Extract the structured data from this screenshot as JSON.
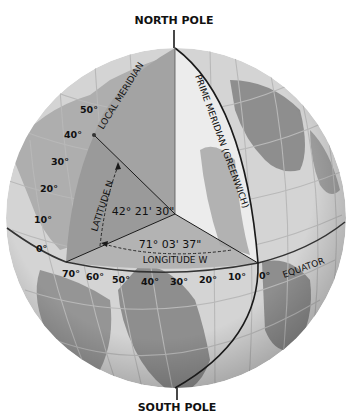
{
  "colors": {
    "ocean": "#d2d2d2",
    "land": "#8c8c8c",
    "grid": "#b4b4b4",
    "cutaway_left": "#a6a6a6",
    "cutaway_right": "#ececec",
    "line": "#1a1a1a"
  },
  "labels": {
    "north_pole": "NORTH POLE",
    "south_pole": "SOUTH POLE",
    "local_meridian": "LOCAL MERIDIAN",
    "prime_meridian": "PRIME MERIDIAN (GREENWICH)",
    "equator": "EQUATOR",
    "latitude_axis": "LATITUDE N",
    "longitude_axis": "LONGITUDE W",
    "latitude_value": "42° 21' 30\"",
    "longitude_value": "71° 03' 37\""
  },
  "latitude_ticks": [
    "50°",
    "40°",
    "30°",
    "20°",
    "10°",
    "0°"
  ],
  "longitude_ticks": [
    "70°",
    "60°",
    "50°",
    "40°",
    "30°",
    "20°",
    "10°",
    "0°"
  ]
}
